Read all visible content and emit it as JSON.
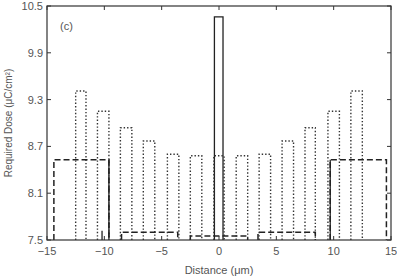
{
  "chart_data": {
    "type": "line",
    "title": "",
    "panel_label": "(c)",
    "xlabel": "Distance (μm)",
    "ylabel": "Required Dose (μC/cm²)",
    "xlim": [
      -15,
      15
    ],
    "ylim": [
      7.5,
      10.5
    ],
    "xticks": [
      -15,
      -10,
      -5,
      0,
      5,
      10,
      15
    ],
    "xtick_labels": [
      "−15",
      "−10",
      "−5",
      "0",
      "5",
      "10",
      "15"
    ],
    "yticks": [
      7.5,
      8.1,
      8.7,
      9.3,
      9.9,
      10.5
    ],
    "ytick_labels": [
      "7.5",
      "8.1",
      "8.7",
      "9.3",
      "9.9",
      "10.5"
    ],
    "grid": false,
    "legend": null,
    "series": [
      {
        "name": "solid",
        "style": "solid",
        "bars": [
          {
            "x0": -0.4,
            "x1": 0.35,
            "y": 10.36
          }
        ],
        "vlines": [
          {
            "x": -9.6,
            "y": 8.53
          },
          {
            "x": 9.7,
            "y": 8.53
          },
          {
            "x": -10.2,
            "y": 7.62
          }
        ]
      },
      {
        "name": "dotted",
        "style": "dotted",
        "bars": [
          {
            "x0": -12.5,
            "x1": -11.6,
            "y": 9.41
          },
          {
            "x0": -10.6,
            "x1": -9.6,
            "y": 9.15
          },
          {
            "x0": -8.6,
            "x1": -7.6,
            "y": 8.94
          },
          {
            "x0": -6.6,
            "x1": -5.6,
            "y": 8.77
          },
          {
            "x0": -4.5,
            "x1": -3.5,
            "y": 8.6
          },
          {
            "x0": -2.5,
            "x1": -1.5,
            "y": 8.58
          },
          {
            "x0": -0.45,
            "x1": 0.45,
            "y": 8.58
          },
          {
            "x0": 1.5,
            "x1": 2.5,
            "y": 8.58
          },
          {
            "x0": 3.5,
            "x1": 4.5,
            "y": 8.6
          },
          {
            "x0": 5.5,
            "x1": 6.5,
            "y": 8.77
          },
          {
            "x0": 7.5,
            "x1": 8.4,
            "y": 8.94
          },
          {
            "x0": 9.5,
            "x1": 10.5,
            "y": 9.15
          },
          {
            "x0": 11.5,
            "x1": 12.5,
            "y": 9.41
          }
        ]
      },
      {
        "name": "dashed",
        "style": "dashed",
        "bars": [
          {
            "x0": -14.4,
            "x1": -9.6,
            "y": 8.53
          },
          {
            "x0": -8.5,
            "x1": -3.6,
            "y": 7.6
          },
          {
            "x0": -2.5,
            "x1": 2.5,
            "y": 7.55
          },
          {
            "x0": 3.4,
            "x1": 8.4,
            "y": 7.6
          },
          {
            "x0": 9.7,
            "x1": 14.6,
            "y": 8.53
          }
        ]
      }
    ]
  }
}
